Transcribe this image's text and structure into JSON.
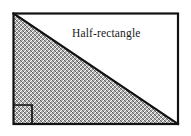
{
  "figure": {
    "title": "Half-rectangle",
    "kind": "geometry-diagram",
    "label": {
      "text": "Half-rectangle",
      "x": 72,
      "y": 26,
      "font_size": 11.5,
      "color": "#1a1a1a"
    },
    "canvas": {
      "width": 191,
      "height": 136,
      "background": "#ffffff"
    },
    "rectangle": {
      "name": "outer-rectangle",
      "x": 13,
      "y": 13,
      "width": 165,
      "height": 111,
      "stroke": "#111111",
      "stroke_width": 2,
      "fill": "none"
    },
    "triangle": {
      "name": "hatched-half-rectangle",
      "vertices": [
        {
          "x": 13,
          "y": 13
        },
        {
          "x": 13,
          "y": 124
        },
        {
          "x": 178,
          "y": 124
        }
      ],
      "fill_pattern": "checkerboard-crosshatch",
      "fill_color": "#5a5a5a",
      "stroke": "#111111",
      "stroke_width": 2,
      "description": "right triangle occupying the lower-left half of the rectangle"
    },
    "right_angle_marker": {
      "name": "right-angle-square",
      "x": 13,
      "y": 105,
      "size": 19,
      "stroke": "#111111",
      "stroke_width": 1.6,
      "fill": "none",
      "at_vertex": "bottom-left"
    },
    "hypotenuse": {
      "name": "hypotenuse",
      "from": {
        "x": 13,
        "y": 13
      },
      "to": {
        "x": 178,
        "y": 124
      },
      "stroke": "#111111",
      "stroke_width": 2
    },
    "colors": {
      "stroke": "#111111",
      "hatch": "#5a5a5a",
      "background": "#ffffff",
      "text": "#1a1a1a"
    }
  }
}
